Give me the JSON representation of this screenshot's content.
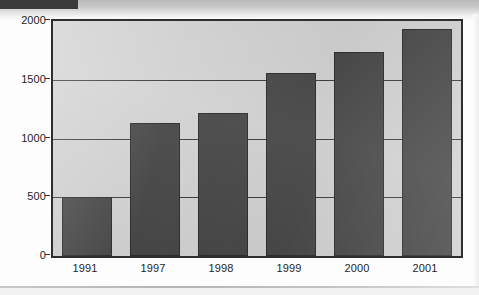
{
  "chart_data": {
    "type": "bar",
    "title": "",
    "xlabel": "",
    "ylabel": "",
    "categories": [
      "1991",
      "1997",
      "1998",
      "1999",
      "2000",
      "2001"
    ],
    "values": [
      500,
      1130,
      1215,
      1560,
      1735,
      1935
    ],
    "ylim": [
      0,
      2000
    ],
    "yticks": [
      0,
      500,
      1000,
      1500,
      2000
    ],
    "ytick_labels": [
      "0",
      "500",
      "1000",
      "1500",
      "2000"
    ],
    "grid": true,
    "legend": "none",
    "bar_color": "#464646",
    "plot_background": "#d2d2d2",
    "axis_color": "#2e2e2e"
  }
}
